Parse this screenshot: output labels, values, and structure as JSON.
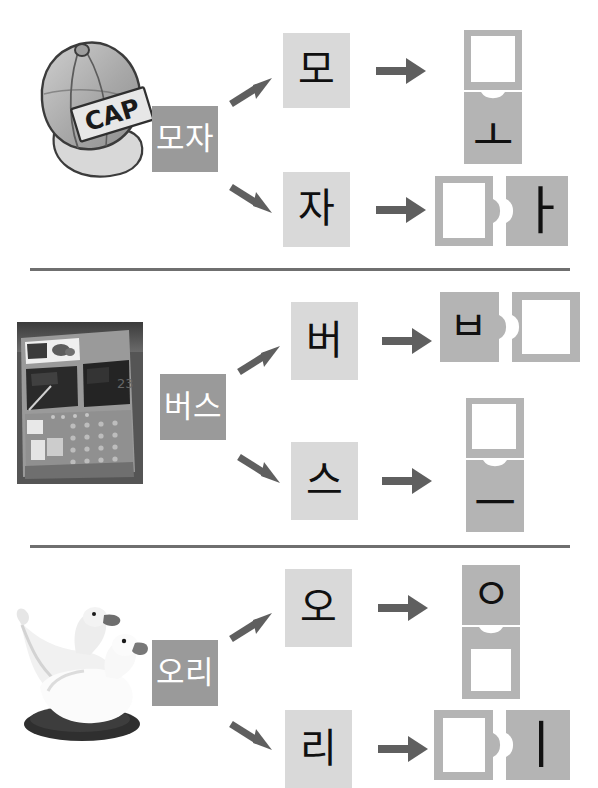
{
  "worksheet": {
    "title": "Korean syllable decomposition worksheet",
    "colors": {
      "word_box_bg": "#9a9a9a",
      "word_box_text": "#ffffff",
      "syllable_box_bg": "#d9d9d9",
      "syllable_box_text": "#101010",
      "piece_fill": "#b4b4b4",
      "piece_hole": "#ffffff",
      "arrow": "#5f5f5f",
      "divider": "#6f6f6f",
      "page_bg": "#ffffff"
    },
    "rows": [
      {
        "id": "row-cap",
        "picture": {
          "name": "cap-illustration",
          "alt": "baseball cap",
          "label": "CAP"
        },
        "word": "모자",
        "branches": [
          {
            "id": "branch-mo",
            "syllable": "모",
            "layout": "vertical",
            "pieces": [
              {
                "glyph": "",
                "filled": false,
                "notch": "none",
                "tab": "none",
                "label": "blank-consonant-mieum"
              },
              {
                "glyph": "ㅗ",
                "filled": true,
                "notch": "top",
                "tab": "none",
                "label": "vowel-o"
              }
            ]
          },
          {
            "id": "branch-ja",
            "syllable": "자",
            "layout": "horizontal",
            "pieces": [
              {
                "glyph": "",
                "filled": false,
                "notch": "none",
                "tab": "right",
                "label": "blank-consonant-jieut"
              },
              {
                "glyph": "ㅏ",
                "filled": true,
                "notch": "left",
                "tab": "none",
                "label": "vowel-a"
              }
            ]
          }
        ]
      },
      {
        "id": "row-bus",
        "picture": {
          "name": "bus-photo",
          "alt": "city bus"
        },
        "word": "버스",
        "branches": [
          {
            "id": "branch-beo",
            "syllable": "버",
            "layout": "horizontal",
            "pieces": [
              {
                "glyph": "ㅂ",
                "filled": true,
                "notch": "none",
                "tab": "right",
                "label": "consonant-bieup"
              },
              {
                "glyph": "",
                "filled": false,
                "notch": "left",
                "tab": "none",
                "label": "blank-vowel-eo"
              }
            ]
          },
          {
            "id": "branch-seu",
            "syllable": "스",
            "layout": "vertical",
            "pieces": [
              {
                "glyph": "",
                "filled": false,
                "notch": "none",
                "tab": "none",
                "label": "blank-consonant-siot"
              },
              {
                "glyph": "ㅡ",
                "filled": true,
                "notch": "top",
                "tab": "none",
                "label": "vowel-eu"
              }
            ]
          }
        ]
      },
      {
        "id": "row-duck",
        "picture": {
          "name": "duck-photo",
          "alt": "two white ducks"
        },
        "word": "오리",
        "branches": [
          {
            "id": "branch-o",
            "syllable": "오",
            "layout": "vertical",
            "pieces": [
              {
                "glyph": "ㅇ",
                "filled": true,
                "notch": "none",
                "tab": "none",
                "label": "consonant-ieung"
              },
              {
                "glyph": "",
                "filled": false,
                "notch": "top",
                "tab": "none",
                "label": "blank-vowel-o"
              }
            ]
          },
          {
            "id": "branch-ri",
            "syllable": "리",
            "layout": "horizontal",
            "pieces": [
              {
                "glyph": "",
                "filled": false,
                "notch": "none",
                "tab": "right",
                "label": "blank-consonant-rieul"
              },
              {
                "glyph": "ㅣ",
                "filled": true,
                "notch": "left",
                "tab": "none",
                "label": "vowel-i"
              }
            ]
          }
        ]
      }
    ]
  }
}
